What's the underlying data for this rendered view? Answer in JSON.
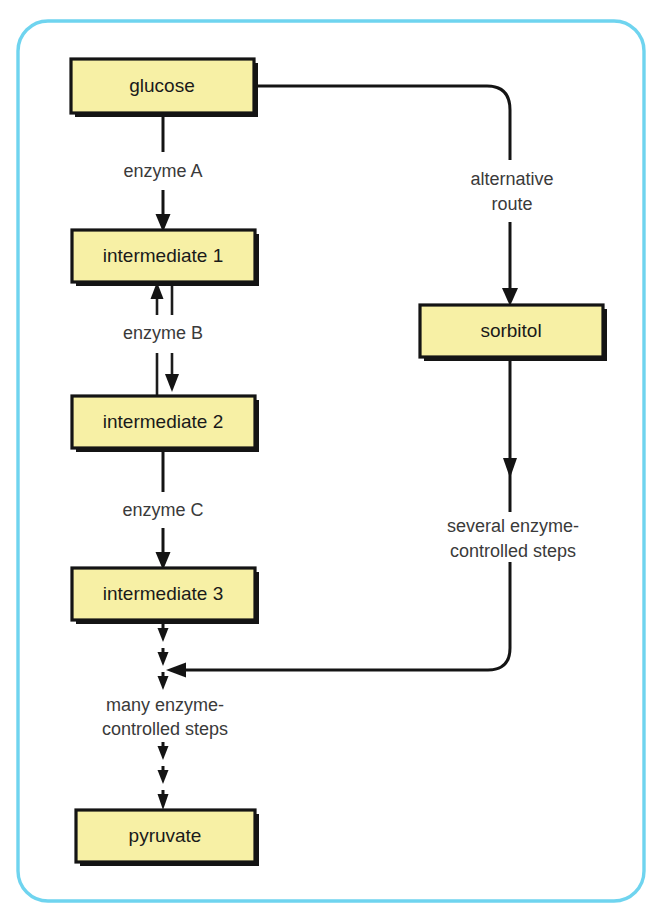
{
  "diagram": {
    "frame_color": "#6fd4ef",
    "node_fill": "#f7f0a5",
    "node_stroke": "#141414",
    "nodes": [
      {
        "id": "glucose",
        "label": "glucose"
      },
      {
        "id": "intermediate1",
        "label": "intermediate 1"
      },
      {
        "id": "intermediate2",
        "label": "intermediate 2"
      },
      {
        "id": "intermediate3",
        "label": "intermediate 3"
      },
      {
        "id": "pyruvate",
        "label": "pyruvate"
      },
      {
        "id": "sorbitol",
        "label": "sorbitol"
      }
    ],
    "edge_labels": {
      "enzyme_a": "enzyme A",
      "enzyme_b": "enzyme B",
      "enzyme_c": "enzyme C",
      "alternative_route_line1": "alternative",
      "alternative_route_line2": "route",
      "several_steps_line1": "several enzyme-",
      "several_steps_line2": "controlled steps",
      "many_steps_line1": "many enzyme-",
      "many_steps_line2": "controlled steps"
    },
    "edges": [
      {
        "from": "glucose",
        "to": "intermediate1",
        "label": "enzyme A",
        "style": "solid",
        "direction": "down"
      },
      {
        "from": "intermediate1",
        "to": "intermediate2",
        "label": "enzyme B",
        "style": "solid",
        "direction": "reversible"
      },
      {
        "from": "intermediate2",
        "to": "intermediate3",
        "label": "enzyme C",
        "style": "solid",
        "direction": "down"
      },
      {
        "from": "intermediate3",
        "to": "pyruvate",
        "label": "many enzyme-controlled steps",
        "style": "dashed",
        "direction": "down"
      },
      {
        "from": "glucose",
        "to": "sorbitol",
        "label": "alternative route",
        "style": "solid",
        "direction": "down"
      },
      {
        "from": "sorbitol",
        "to": "pyruvate",
        "label": "several enzyme-controlled steps",
        "style": "solid",
        "direction": "down"
      }
    ]
  }
}
